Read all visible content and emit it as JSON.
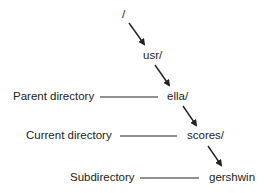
{
  "nodes": {
    "root": "/",
    "usr": "usr/",
    "ella": "ella/",
    "scores": "scores/",
    "gershwin": "gershwin"
  },
  "annotations": {
    "parent": "Parent directory",
    "current": "Current directory",
    "sub": "Subdirectory"
  },
  "colors": {
    "ink": "#222222"
  }
}
